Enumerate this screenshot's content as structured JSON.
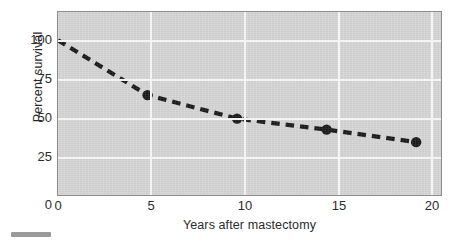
{
  "chart_data": {
    "type": "line",
    "title": "",
    "xlabel": "Years after mastectomy",
    "ylabel": "Percent survival",
    "x": [
      0,
      5,
      10,
      15,
      20
    ],
    "values": [
      100,
      65,
      50,
      43,
      35
    ],
    "series": [
      {
        "name": "Percent survival",
        "x": [
          0,
          5,
          10,
          15,
          20
        ],
        "values": [
          100,
          65,
          50,
          43,
          35
        ]
      }
    ],
    "xtick_labels": [
      "0",
      "5",
      "10",
      "15",
      "20"
    ],
    "xticks": [
      0,
      5,
      10,
      15,
      20
    ],
    "ytick_labels": [
      "0",
      "25",
      "50",
      "75",
      "100"
    ],
    "yticks": [
      0,
      25,
      50,
      75,
      100
    ],
    "xlim": [
      0,
      21.5
    ],
    "ylim": [
      0,
      118
    ],
    "grid": true,
    "legend": "none",
    "marker": "filled-circle",
    "linestyle": "dashed",
    "line_color": "#1a1a1a",
    "marker_color": "#1a1a1a",
    "plot_background": "#d6d6d6",
    "grid_color": "#f4f4f4",
    "axis_color": "#8c8c8c",
    "markers_at": [
      5,
      10,
      15,
      20
    ],
    "annotations": []
  },
  "figure": {
    "background": "#ffffff",
    "corner_mark_color": "#9a9a9a"
  }
}
